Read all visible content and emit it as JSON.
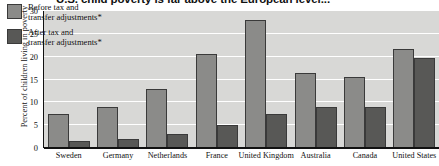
{
  "chart_data": {
    "type": "bar",
    "title": "U.S. child poverty is far above the European level...",
    "xlabel": "",
    "ylabel": "Percent of children living in poverty",
    "ylim": [
      0,
      30
    ],
    "yticks": [
      0,
      5,
      10,
      15,
      20,
      25,
      30
    ],
    "grid": true,
    "legend_position": "top-left",
    "categories": [
      "Sweden",
      "Germany",
      "Netherlands",
      "France",
      "United Kingdom",
      "Australia",
      "Canada",
      "United States"
    ],
    "series": [
      {
        "name": "Before tax and\ntransfer adjustments*",
        "color": "#8b8b89",
        "values": [
          7.5,
          9.0,
          13.0,
          20.5,
          28.0,
          16.5,
          15.5,
          21.7
        ]
      },
      {
        "name": "After tax and\ntransfer adjustments*",
        "color": "#585856",
        "values": [
          1.5,
          2.0,
          3.0,
          5.0,
          7.5,
          9.0,
          9.0,
          19.7
        ]
      }
    ]
  },
  "colors": {
    "plot_background": "#d8d8d6",
    "gridline": "#ffffff",
    "axis": "#111111",
    "before_bar": "#8b8b89",
    "after_bar": "#585856"
  }
}
